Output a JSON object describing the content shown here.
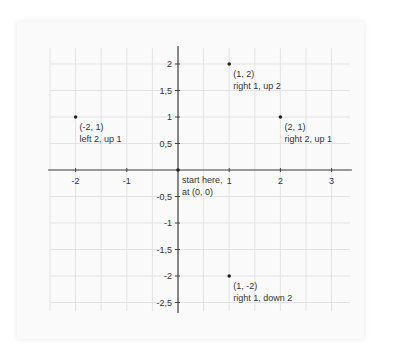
{
  "chart_data": {
    "type": "scatter",
    "title": "",
    "xlabel": "",
    "ylabel": "",
    "xlim": [
      -2.5,
      3.4
    ],
    "ylim": [
      -2.7,
      2.3
    ],
    "grid": true,
    "legend": null,
    "x_ticks": [
      -2,
      -1,
      1,
      2,
      3
    ],
    "x_tick_labels": [
      "-2",
      "-1",
      "1",
      "2",
      "3"
    ],
    "y_ticks": [
      2,
      1.5,
      1,
      0.5,
      -0.5,
      -1,
      -1.5,
      -2,
      -2.5
    ],
    "y_tick_labels": [
      "2",
      "1,5",
      "1",
      "0,5",
      "-0,5",
      "-1",
      "-1,5",
      "-2",
      "-2,5"
    ],
    "points": [
      {
        "x": 0,
        "y": 0,
        "label_line1": "start here,",
        "label_line2": "at (0, 0)"
      },
      {
        "x": -2,
        "y": 1,
        "label_line1": "(-2, 1)",
        "label_line2": "left 2, up 1"
      },
      {
        "x": 1,
        "y": 2,
        "label_line1": "(1, 2)",
        "label_line2": "right 1, up 2"
      },
      {
        "x": 2,
        "y": 1,
        "label_line1": "(2, 1)",
        "label_line2": "right 2, up 1"
      },
      {
        "x": 1,
        "y": -2,
        "label_line1": "(1, -2)",
        "label_line2": "right 1, down 2"
      }
    ]
  },
  "colors": {
    "axis": "#444444",
    "grid": "#e3e3e3",
    "point": "#222222",
    "text": "#333333",
    "card_bg": "#fafafa"
  }
}
